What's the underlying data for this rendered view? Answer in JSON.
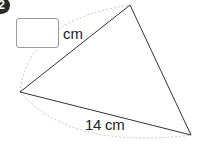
{
  "problem": {
    "number": "2",
    "answer_box": {
      "value": "",
      "unit": "cm"
    },
    "given_side": {
      "label": "14 cm"
    }
  },
  "figure": {
    "type": "triangle",
    "vertices": {
      "top": [
        130,
        5
      ],
      "left": [
        20,
        92
      ],
      "bottom_right": [
        191,
        135
      ]
    },
    "line_color": "#333333",
    "arc_color": "#bbbbbb"
  }
}
